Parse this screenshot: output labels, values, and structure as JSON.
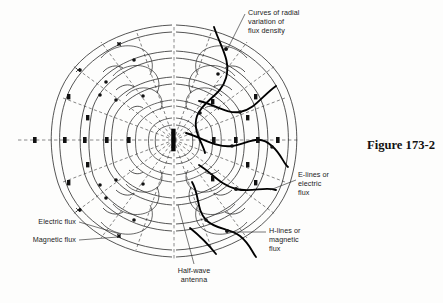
{
  "figure": {
    "number_label": "Figure 173-2",
    "title_caption": "Radiation field pattern of a half-wave antenna"
  },
  "annotations": {
    "curves_radial": {
      "lines": [
        "Curves of radial",
        "variation of",
        "flux density"
      ]
    },
    "e_lines": {
      "lines": [
        "E-lines or",
        "electric",
        "flux"
      ]
    },
    "h_lines": {
      "lines": [
        "H-lines or",
        "magnetic",
        "flux"
      ]
    },
    "electric_flux": {
      "lines": [
        "Electric flux"
      ]
    },
    "magnetic_flux": {
      "lines": [
        "Magnetic flux"
      ]
    },
    "half_wave": {
      "lines": [
        "Half-wave",
        "antenna"
      ]
    }
  },
  "colors": {
    "background": "#fdfdfc",
    "field_line": "#1d1d1d",
    "flux_density_curve": "#000000",
    "radial_dashed": "#3a3a3a",
    "text": "#1b1b1b"
  },
  "diagram": {
    "center_x": 174,
    "center_y": 140,
    "antenna_half_height": 11,
    "radial_angles_deg": [
      0,
      22,
      45,
      68,
      90,
      112,
      135,
      158,
      180,
      202,
      225,
      248,
      270,
      292,
      315,
      338
    ],
    "loop_count_per_side": 5,
    "marker_symbol_names": [
      "dot-marker",
      "cross-marker"
    ]
  }
}
